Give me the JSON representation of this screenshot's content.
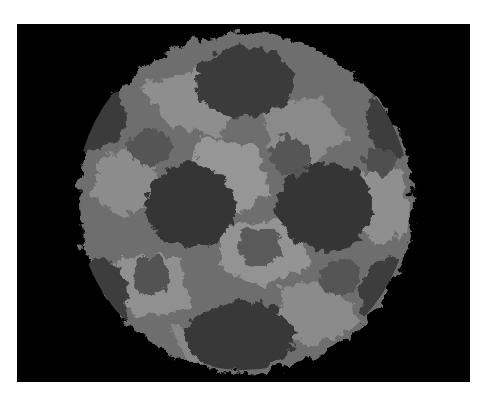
{
  "image": {
    "subject": "space-filling molecular render of an icosahedral virus capsid",
    "background_color": "#000000",
    "frame_color": "#ffffff",
    "palette": [
      "#2e2e2e",
      "#3d3d3d",
      "#4f4f4f",
      "#636363",
      "#787878",
      "#8c8c8c",
      "#9e9e9e"
    ]
  }
}
